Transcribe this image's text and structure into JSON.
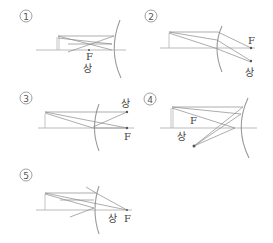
{
  "figure": {
    "options": [
      {
        "number": "1",
        "focus_label": "F",
        "image_label": "상"
      },
      {
        "number": "2",
        "focus_label": "F",
        "image_label": "상"
      },
      {
        "number": "3",
        "focus_label": "F",
        "image_label": "상"
      },
      {
        "number": "4",
        "focus_label": "F",
        "image_label": "상"
      },
      {
        "number": "5",
        "focus_label": "F",
        "image_label": "상"
      }
    ]
  },
  "colors": {
    "line": "#8a8a8a",
    "text": "#444444"
  }
}
